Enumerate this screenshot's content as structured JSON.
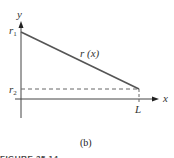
{
  "figure": {
    "axis_y_label": "y",
    "axis_x_label": "x",
    "r1_label": "r",
    "r1_sub": "1",
    "r2_label": "r",
    "r2_sub": "2",
    "curve_label": "r (x)",
    "L_label": "L",
    "panel_label": "(b)",
    "caption_partial": "FIGURE 35.14"
  },
  "colors": {
    "line": "#555555",
    "axis": "#444444",
    "dashed": "#666666"
  }
}
